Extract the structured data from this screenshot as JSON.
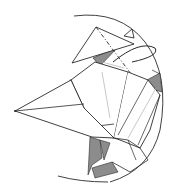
{
  "diagram": {
    "type": "origami-fold-step",
    "colors": {
      "background": "#ffffff",
      "line": "#2a2a2a",
      "shade": "#8c8c8c",
      "light_line": "#b0b0b0"
    },
    "symbols": [
      {
        "name": "circular-frame",
        "kind": "arc"
      },
      {
        "name": "fold-arrow",
        "kind": "curved-arrow"
      },
      {
        "name": "valley-fold-line",
        "kind": "dash-dot-line"
      }
    ]
  }
}
